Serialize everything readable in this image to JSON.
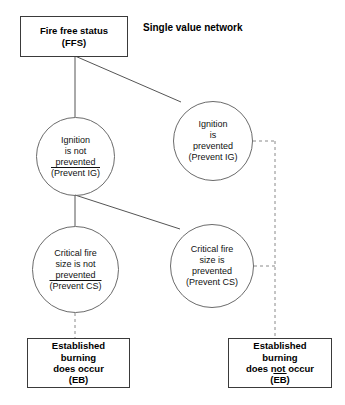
{
  "diagram": {
    "title": "Single value network",
    "type": "event-tree",
    "nodes": {
      "ffs": {
        "shape": "rectangle",
        "line1": "Fire free status",
        "line2": "(FFS)"
      },
      "ig_not_prevented": {
        "shape": "circle",
        "line1": "Ignition",
        "line2": "is not",
        "line3": "prevented",
        "line4": "(Prevent IG)",
        "line4_overline": true
      },
      "ig_prevented": {
        "shape": "circle",
        "line1": "Ignition",
        "line2": "is",
        "line3": "prevented",
        "line4": "(Prevent IG)",
        "line4_overline": false
      },
      "cs_not_prevented": {
        "shape": "circle",
        "line1": "Critical fire",
        "line2": "size is not",
        "line3": "prevented",
        "line4": "(Prevent CS)",
        "line4_overline": true
      },
      "cs_prevented": {
        "shape": "circle",
        "line1": "Critical fire",
        "line2": "size is",
        "line3": "prevented",
        "line4": "(Prevent CS)",
        "line4_overline": false
      },
      "eb_occurs": {
        "shape": "rectangle",
        "line1": "Established",
        "line2": "burning",
        "line3": "does occur",
        "line4": "(EB)",
        "line4_overline": false
      },
      "eb_not_occurs": {
        "shape": "rectangle",
        "line1": "Established",
        "line2": "burning",
        "line3": "does not occur",
        "line4": "(EB)",
        "line4_overline": true
      }
    },
    "colors": {
      "box_stroke": "#3a3a3a",
      "circle_stroke": "#6b6b6b",
      "connector": "#555555",
      "dashed_connector": "#8a8a8a",
      "text": "#000000",
      "background": "#ffffff"
    }
  }
}
